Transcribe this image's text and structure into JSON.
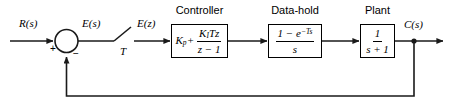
{
  "diagram": {
    "line_color": "#1a1a1a",
    "background": "#ffffff"
  },
  "signals": {
    "reference": "R(s)",
    "error_continuous": "E(s)",
    "error_sampled": "E(z)",
    "sampling_period": "T",
    "output": "C(s)"
  },
  "summing_junction": {
    "name": "summing-junction",
    "plus_sign": "+",
    "minus_sign": "−"
  },
  "blocks": [
    {
      "id": "controller",
      "caption": "Controller",
      "gain_term": "K",
      "gain_sub": "p",
      "operator": "+",
      "num_gain": "K",
      "num_sub": "I",
      "num_rest": "Tz",
      "den": "z − 1"
    },
    {
      "id": "data-hold",
      "caption": "Data-hold",
      "num_lead": "1 − e",
      "num_exp": "−Ts",
      "den": "s"
    },
    {
      "id": "plant",
      "caption": "Plant",
      "num": "1",
      "den": "s + 1"
    }
  ]
}
